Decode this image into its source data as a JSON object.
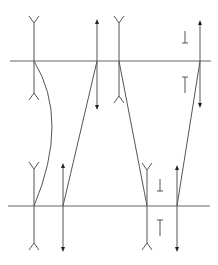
{
  "diagram": {
    "caption": "",
    "colors": {
      "line": "#555555",
      "axis": "#666666",
      "arrowhead": "#222222",
      "background": "#ffffff"
    },
    "axes": [
      {
        "id": "top-axis",
        "y": 61,
        "x1": 10,
        "x2": 211
      },
      {
        "id": "bottom-axis",
        "y": 206,
        "x1": 8,
        "x2": 210
      }
    ],
    "elements": [
      {
        "type": "diverging-element",
        "x": 34,
        "y_top": 16,
        "y_bottom": 100,
        "axis": "top"
      },
      {
        "type": "converging-element",
        "x": 97,
        "y_top": 19,
        "y_bottom": 110,
        "axis": "top"
      },
      {
        "type": "diverging-element",
        "x": 119,
        "y_top": 16,
        "y_bottom": 103,
        "axis": "top"
      },
      {
        "type": "converging-element",
        "x": 200,
        "y_top": 20,
        "y_bottom": 108,
        "axis": "top"
      },
      {
        "type": "diverging-element",
        "x": 34,
        "y_top": 162,
        "y_bottom": 250,
        "axis": "bottom"
      },
      {
        "type": "converging-element",
        "x": 63,
        "y_top": 163,
        "y_bottom": 252,
        "axis": "bottom"
      },
      {
        "type": "diverging-element",
        "x": 147,
        "y_top": 163,
        "y_bottom": 250,
        "axis": "bottom"
      },
      {
        "type": "converging-element",
        "x": 177,
        "y_top": 165,
        "y_bottom": 252,
        "axis": "bottom"
      }
    ],
    "markers": [
      {
        "type": "focal-mark-down",
        "x": 185,
        "y": 37
      },
      {
        "type": "focal-mark-up",
        "x": 185,
        "y": 85
      },
      {
        "type": "focal-mark-down",
        "x": 160,
        "y": 185
      },
      {
        "type": "focal-mark-up",
        "x": 160,
        "y": 228
      }
    ],
    "rays": [
      {
        "type": "curve",
        "from": [
          34,
          61
        ],
        "ctrl": [
          70,
          120
        ],
        "to": [
          34,
          206
        ]
      },
      {
        "type": "line",
        "from": [
          97,
          61
        ],
        "to": [
          63,
          206
        ]
      },
      {
        "type": "line",
        "from": [
          119,
          61
        ],
        "to": [
          147,
          206
        ]
      },
      {
        "type": "line",
        "from": [
          200,
          61
        ],
        "to": [
          177,
          206
        ]
      }
    ]
  }
}
